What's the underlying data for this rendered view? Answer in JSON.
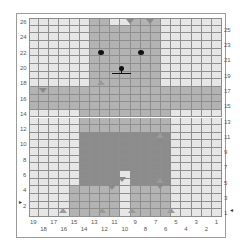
{
  "chart": {
    "columns": 19,
    "rows": 26,
    "colors": {
      "background": "#e6e6e6",
      "body": "#b3b3b3",
      "shorts": "#8c8c8c",
      "marker": "#8a8a8a",
      "gridline": "#8e8e8e"
    },
    "left_row_labels": [
      "26",
      "24",
      "22",
      "20",
      "18",
      "16",
      "14",
      "12",
      "10",
      "8",
      "6",
      "4",
      "2"
    ],
    "right_row_labels": [
      "25",
      "23",
      "21",
      "19",
      "17",
      "15",
      "13",
      "11",
      "9",
      "7",
      "5",
      "3",
      "1"
    ],
    "bottom_col_labels_upper": [
      "19",
      "17",
      "15",
      "13",
      "11",
      "9",
      "7",
      "5",
      "3",
      "1"
    ],
    "bottom_col_labels_lower": [
      "18",
      "16",
      "14",
      "12",
      "10",
      "8",
      "6",
      "4",
      "2"
    ],
    "start_row_left_marker": "2",
    "start_row_right_marker": "1",
    "regions": [
      {
        "name": "head",
        "rows": [
          18,
          26
        ],
        "cols_from_left": [
          6,
          12
        ],
        "color": "body"
      },
      {
        "name": "head-top-gap",
        "rows": [
          26,
          26
        ],
        "cols_from_left": [
          8,
          9
        ],
        "color": "background"
      },
      {
        "name": "arms",
        "rows": [
          15,
          17
        ],
        "cols_from_left": [
          0,
          18
        ],
        "color": "body"
      },
      {
        "name": "torso",
        "rows": [
          12,
          14
        ],
        "cols_from_left": [
          5,
          13
        ],
        "color": "body"
      },
      {
        "name": "shorts",
        "rows": [
          5,
          11
        ],
        "cols_from_left": [
          5,
          13
        ],
        "color": "shorts"
      },
      {
        "name": "legs",
        "rows": [
          1,
          4
        ],
        "cols_from_left": [
          4,
          13
        ],
        "color": "body"
      },
      {
        "name": "leg-gap",
        "rows": [
          1,
          6
        ],
        "cols_from_left": [
          9,
          9
        ],
        "color": "background"
      }
    ]
  }
}
